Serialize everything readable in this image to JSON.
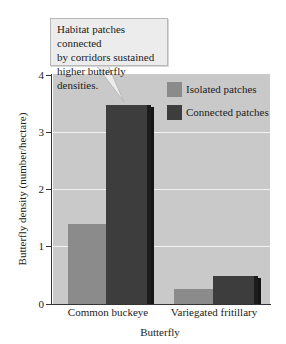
{
  "callout": {
    "lines": [
      "Habitat patches connected",
      "by corridors sustained",
      "higher butterfly densities."
    ]
  },
  "axes": {
    "ylabel": "Butterfly density (number/hectare)",
    "xlabel": "Butterfly",
    "yticks": [
      "0",
      "1",
      "2",
      "3",
      "4"
    ]
  },
  "legend": {
    "items": [
      {
        "label": "Isolated patches",
        "color": "#8b8b8b"
      },
      {
        "label": "Connected patches",
        "color": "#3d3d3d"
      }
    ]
  },
  "categories": [
    "Common buckeye",
    "Variegated fritillary"
  ],
  "colors": {
    "plot_background": "#c9c9c9",
    "gridline": "#f2f2f2",
    "isolated": "#8b8b8b",
    "connected": "#3d3d3d"
  },
  "chart_data": {
    "type": "bar",
    "title": "",
    "annotation": "Habitat patches connected by corridors sustained higher butterfly densities.",
    "xlabel": "Butterfly",
    "ylabel": "Butterfly density (number/hectare)",
    "categories": [
      "Common buckeye",
      "Variegated fritillary"
    ],
    "series": [
      {
        "name": "Isolated patches",
        "values": [
          1.4,
          0.26
        ]
      },
      {
        "name": "Connected patches",
        "values": [
          3.48,
          0.49
        ]
      }
    ],
    "ylim": [
      0,
      4
    ],
    "yticks": [
      0,
      1,
      2,
      3,
      4
    ],
    "grid": true,
    "legend_position": "upper right (inside plot)"
  }
}
